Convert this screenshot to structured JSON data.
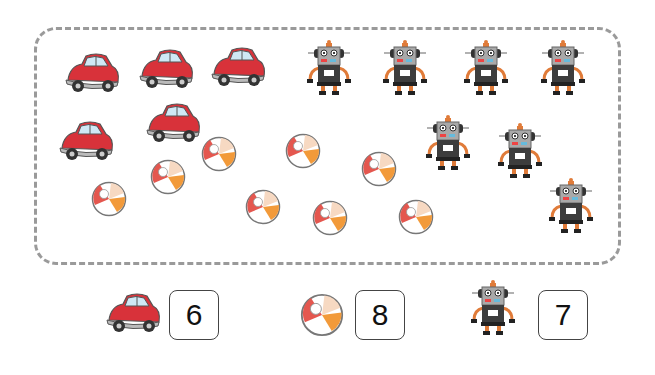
{
  "scene": {
    "cars": [
      {
        "x": 62,
        "y": 50
      },
      {
        "x": 136,
        "y": 46
      },
      {
        "x": 208,
        "y": 44
      },
      {
        "x": 56,
        "y": 118
      },
      {
        "x": 143,
        "y": 100
      }
    ],
    "balls": [
      {
        "x": 91,
        "y": 181
      },
      {
        "x": 150,
        "y": 159
      },
      {
        "x": 201,
        "y": 136
      },
      {
        "x": 245,
        "y": 189
      },
      {
        "x": 285,
        "y": 133
      },
      {
        "x": 312,
        "y": 200
      },
      {
        "x": 361,
        "y": 151
      },
      {
        "x": 398,
        "y": 199
      }
    ],
    "robots": [
      {
        "x": 306,
        "y": 38
      },
      {
        "x": 382,
        "y": 38
      },
      {
        "x": 463,
        "y": 38
      },
      {
        "x": 540,
        "y": 38
      },
      {
        "x": 425,
        "y": 113
      },
      {
        "x": 497,
        "y": 121
      },
      {
        "x": 548,
        "y": 176
      }
    ]
  },
  "answers": {
    "car": {
      "icon": "car-icon",
      "value": "6"
    },
    "ball": {
      "icon": "beach-ball-icon",
      "value": "8"
    },
    "robot": {
      "icon": "robot-icon",
      "value": "7"
    }
  },
  "colors": {
    "car_body": "#d8323a",
    "car_window": "#cfe8f5",
    "ball_accent": "#f29a3a",
    "robot_body": "#3d3d3d",
    "robot_head": "#a9a9a9",
    "robot_legs": "#e07b39",
    "frame_border": "#9a9a9a"
  }
}
